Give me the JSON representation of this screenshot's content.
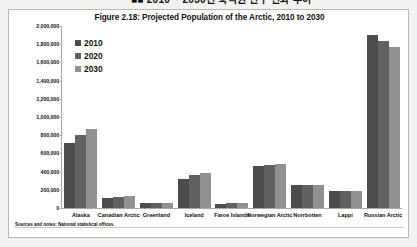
{
  "top_caption": "■■ 2010 ~ 2030년 북극권 인구 변화 추이",
  "figure": {
    "title": "Figure 2.18: Projected Population of the Arctic, 2010 to 2030",
    "note": "Sources and notes: National statistical offices."
  },
  "legend": {
    "position": "top-left",
    "entries": [
      {
        "label": "2010",
        "color": "#4c4c4c"
      },
      {
        "label": "2020",
        "color": "#616161"
      },
      {
        "label": "2030",
        "color": "#919191"
      }
    ]
  },
  "chart_data": {
    "type": "bar",
    "title": "Figure 2.18: Projected Population of the Arctic, 2010 to 2030",
    "xlabel": "",
    "ylabel": "",
    "ylim": [
      0,
      2000000
    ],
    "ytick_labels": [
      "2,000,000",
      "1,800,000",
      "1,600,000",
      "1,400,000",
      "1,200,000",
      "1,000,000",
      "800,000",
      "600,000",
      "400,000",
      "200,000",
      "0"
    ],
    "ytick_values": [
      2000000,
      1800000,
      1600000,
      1400000,
      1200000,
      1000000,
      800000,
      600000,
      400000,
      200000,
      0
    ],
    "grid": false,
    "legend_position": "top-left",
    "categories": [
      "Alaska",
      "Canadian Arctic",
      "Greenland",
      "Iceland",
      "Faroe Islands",
      "Norwegian Arctic",
      "Norrbotten",
      "Lappi",
      "Russian Arctic"
    ],
    "series": [
      {
        "name": "2010",
        "color": "#4c4c4c",
        "values": [
          710000,
          110000,
          57000,
          318000,
          49000,
          463000,
          250000,
          183000,
          1900000
        ]
      },
      {
        "name": "2020",
        "color": "#616161",
        "values": [
          800000,
          124000,
          58000,
          358000,
          50000,
          478000,
          252000,
          184000,
          1833000
        ]
      },
      {
        "name": "2030",
        "color": "#919191",
        "values": [
          866000,
          133000,
          58000,
          390000,
          50000,
          480000,
          250000,
          182000,
          1772000
        ]
      }
    ]
  }
}
